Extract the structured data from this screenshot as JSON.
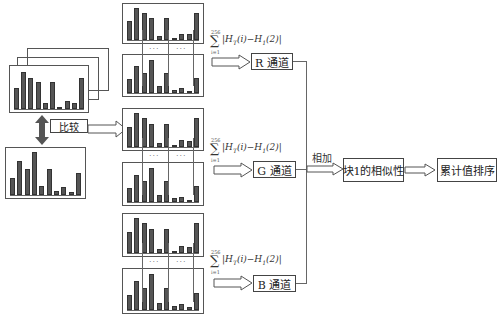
{
  "diagram": {
    "compare_label": "比较",
    "channels": [
      {
        "id": "r",
        "label": "R 通道"
      },
      {
        "id": "g",
        "label": "G 通道"
      },
      {
        "id": "b",
        "label": "B 通道"
      }
    ],
    "formula": {
      "sum_upper": "256",
      "sum_lower": "i=1",
      "sigma": "∑",
      "expression": "|H_T(i)−H_1(2)|",
      "expression_display": "|H",
      "sub_T": "T",
      "mid": "(i)−H",
      "sub_1": "1",
      "tail": "(2)|"
    },
    "ellipsis": "···",
    "add_label": "相加",
    "similarity_label": "块1的相似性",
    "sort_label": "累计值排序"
  },
  "histograms": {
    "reference": [
      0.55,
      0.95,
      0.8,
      0.7,
      0.15,
      0.7,
      0.05,
      0.2,
      0.15,
      0.8
    ],
    "query": [
      0.4,
      0.8,
      0.6,
      1.0,
      0.2,
      0.6,
      0.1,
      0.18,
      0.08,
      0.52
    ],
    "top_pair": [
      0.6,
      1.0,
      0.85,
      0.68,
      0.12,
      0.68,
      0.05,
      0.2,
      0.18,
      0.85
    ],
    "bottom_pair": [
      0.4,
      0.78,
      0.6,
      0.98,
      0.2,
      0.6,
      0.1,
      0.15,
      0.07,
      0.45
    ]
  },
  "colors": {
    "stroke": "#555555",
    "bar": "#555555",
    "text": "#333333"
  }
}
